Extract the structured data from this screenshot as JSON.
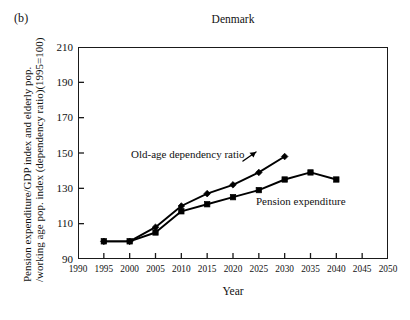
{
  "panel_label": "(b)",
  "axis": {
    "y_label_line1": "Pension expenditure/GDP index and elderly pop.",
    "y_label_line2": "/working age pop. index (dependency ratio)(1995=100)",
    "x_label": "Year"
  },
  "chart_data": {
    "type": "line",
    "title": "Denmark",
    "xlabel": "Year",
    "ylabel": "Pension expenditure/GDP index and elderly pop. /working age pop. index (dependency ratio)(1995=100)",
    "xlim": [
      1990,
      2050
    ],
    "ylim": [
      90,
      210
    ],
    "xticks": [
      1990,
      1995,
      2000,
      2005,
      2010,
      2015,
      2020,
      2025,
      2030,
      2035,
      2040,
      2045,
      2050
    ],
    "yticks": [
      90,
      110,
      130,
      150,
      170,
      190,
      210
    ],
    "grid": false,
    "legend": "in-plot annotations",
    "series": [
      {
        "name": "Old-age dependency ratio",
        "marker": "diamond",
        "color": "#000000",
        "x": [
          1995,
          2000,
          2005,
          2010,
          2015,
          2020,
          2025,
          2030
        ],
        "values": [
          100,
          100,
          108,
          120,
          127,
          132,
          139,
          148
        ]
      },
      {
        "name": "Pension expenditure",
        "marker": "square",
        "color": "#000000",
        "x": [
          1995,
          2000,
          2005,
          2010,
          2015,
          2020,
          2025,
          2030,
          2035,
          2040
        ],
        "values": [
          100,
          100,
          105,
          117,
          121,
          125,
          129,
          135,
          139,
          135
        ]
      }
    ]
  }
}
